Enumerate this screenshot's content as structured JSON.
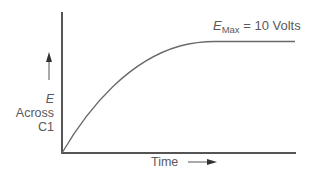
{
  "diagram": {
    "y_axis": {
      "label_symbol": "E",
      "label_line2": "Across",
      "label_line3": "C1",
      "arrow": "up"
    },
    "x_axis": {
      "label": "Time",
      "arrow": "right"
    },
    "annotation": {
      "symbol": "E",
      "subscript": "Max",
      "equals": "=",
      "value": "10 Volts"
    },
    "curve": {
      "shape": "exponential rise to plateau",
      "start": "origin",
      "plateau_value": "10 Volts"
    },
    "colors": {
      "axis": "#555555",
      "curve": "#6a6a6a",
      "text": "#5a5a5a"
    }
  }
}
